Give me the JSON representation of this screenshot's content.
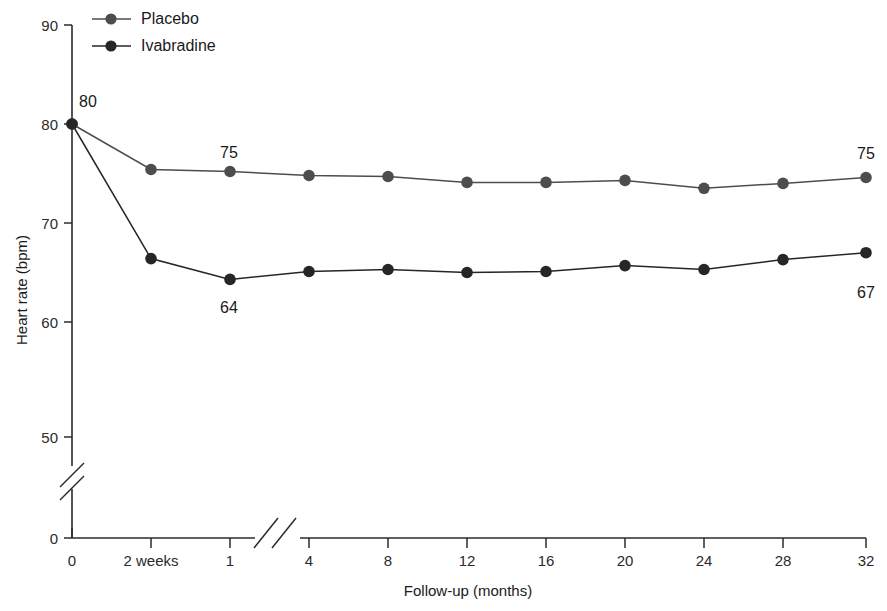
{
  "chart_data": {
    "type": "line",
    "title": "",
    "xlabel": "Follow-up (months)",
    "ylabel": "Heart rate (bpm)",
    "categories": [
      "0",
      "2 weeks",
      "1",
      "4",
      "8",
      "12",
      "16",
      "20",
      "24",
      "28",
      "32"
    ],
    "x_tick_labels": [
      "0",
      "2 weeks",
      "1",
      "4",
      "8",
      "12",
      "16",
      "20",
      "24",
      "28",
      "32"
    ],
    "y_tick_labels": [
      "0",
      "50",
      "60",
      "70",
      "80",
      "90"
    ],
    "y_ticks": [
      0,
      50,
      60,
      70,
      80,
      90
    ],
    "ylim": [
      50,
      90
    ],
    "y_axis_break": true,
    "x_axis_break": true,
    "x_break_between": [
      "1",
      "4"
    ],
    "grid": false,
    "legend_position": "top-left",
    "series": [
      {
        "name": "Placebo",
        "color": "#4d4d4d",
        "values": [
          80.0,
          75.4,
          75.2,
          74.8,
          74.7,
          74.1,
          74.1,
          74.3,
          73.5,
          74.0,
          74.6
        ]
      },
      {
        "name": "Ivabradine",
        "color": "#262626",
        "values": [
          80.0,
          66.4,
          64.3,
          65.1,
          65.3,
          65.0,
          65.1,
          65.7,
          65.3,
          66.3,
          67.0
        ]
      }
    ],
    "annotations": [
      {
        "text": "80",
        "series": "both",
        "category_index": 0,
        "position": "above-right"
      },
      {
        "text": "75",
        "series": "Placebo",
        "category_index": 2,
        "position": "above"
      },
      {
        "text": "75",
        "series": "Placebo",
        "category_index": 10,
        "position": "above"
      },
      {
        "text": "64",
        "series": "Ivabradine",
        "category_index": 2,
        "position": "below"
      },
      {
        "text": "67",
        "series": "Ivabradine",
        "category_index": 10,
        "position": "below"
      }
    ]
  },
  "legend": {
    "items": [
      {
        "label": "Placebo",
        "color": "#4d4d4d"
      },
      {
        "label": "Ivabradine",
        "color": "#262626"
      }
    ]
  },
  "axis": {
    "y_title": "Heart rate (bpm)",
    "x_title": "Follow-up (months)"
  },
  "labels": {
    "y0": "0",
    "y50": "50",
    "y60": "60",
    "y70": "70",
    "y80": "80",
    "y90": "90",
    "x0": "0",
    "x1": "2 weeks",
    "x2": "1",
    "x3": "4",
    "x4": "8",
    "x5": "12",
    "x6": "16",
    "x7": "20",
    "x8": "24",
    "x9": "28",
    "x10": "32",
    "ann_start": "80",
    "ann_placebo_early": "75",
    "ann_placebo_end": "75",
    "ann_iva_early": "64",
    "ann_iva_end": "67"
  }
}
